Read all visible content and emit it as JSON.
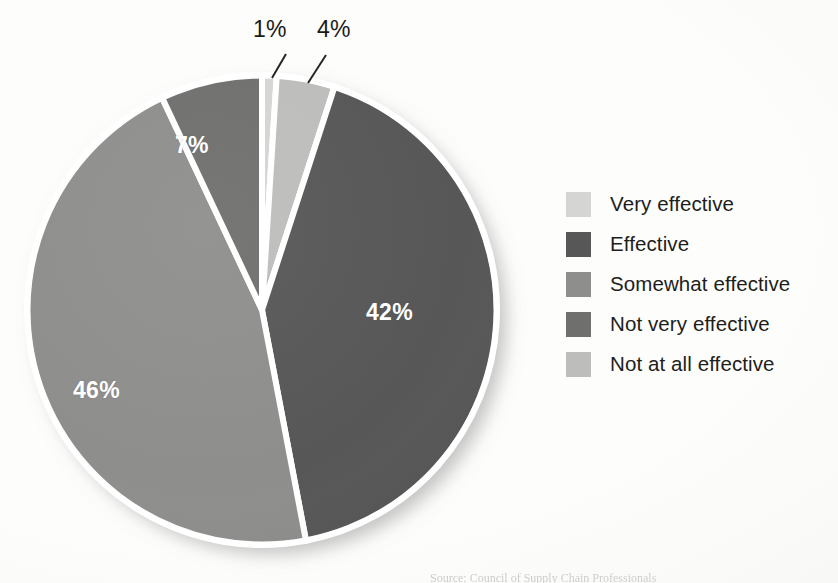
{
  "figure": {
    "background_color": "#fdfdfc",
    "separator_color": "#ffffff",
    "caption_partial": "Source: Council of Supply Chain Professionals"
  },
  "chart_data": {
    "type": "pie",
    "title": "",
    "subtitle": "",
    "xlabel": "",
    "ylabel": "",
    "grid": false,
    "legend_position": "right",
    "start_angle_deg": 0,
    "direction": "clockwise",
    "units": "percent",
    "total": 100,
    "categories": [
      "Very effective",
      "Effective",
      "Somewhat effective",
      "Not very effective",
      "Not at all effective"
    ],
    "values": [
      1,
      42,
      46,
      7,
      4
    ],
    "value_labels": [
      "1%",
      "42%",
      "46%",
      "7%",
      "4%"
    ],
    "colors": [
      "#d5d5d3",
      "#575757",
      "#8e8e8c",
      "#6f6f6e",
      "#bdbdbb"
    ],
    "slices": [
      {
        "label": "Very effective",
        "value": 1,
        "value_label": "1%",
        "color": "#d5d5d3",
        "label_placement": "outside",
        "label_color": "#1a1a18",
        "leader_line": true
      },
      {
        "label": "Effective",
        "value": 42,
        "value_label": "42%",
        "color": "#575757",
        "label_placement": "inside",
        "label_color": "#ffffff",
        "leader_line": false
      },
      {
        "label": "Somewhat effective",
        "value": 46,
        "value_label": "46%",
        "color": "#8e8e8c",
        "label_placement": "inside",
        "label_color": "#ffffff",
        "leader_line": false
      },
      {
        "label": "Not very effective",
        "value": 7,
        "value_label": "7%",
        "color": "#6f6f6e",
        "label_placement": "inside",
        "label_color": "#ffffff",
        "leader_line": false
      },
      {
        "label": "Not at all effective",
        "value": 4,
        "value_label": "4%",
        "color": "#bdbdbb",
        "label_placement": "outside",
        "label_color": "#1a1a18",
        "leader_line": true
      }
    ]
  },
  "legend": {
    "items": [
      {
        "label": "Very effective",
        "color": "#d5d5d3"
      },
      {
        "label": "Effective",
        "color": "#575757"
      },
      {
        "label": "Somewhat effective",
        "color": "#8e8e8c"
      },
      {
        "label": "Not very effective",
        "color": "#6f6f6e"
      },
      {
        "label": "Not at all effective",
        "color": "#bdbdbb"
      }
    ]
  }
}
